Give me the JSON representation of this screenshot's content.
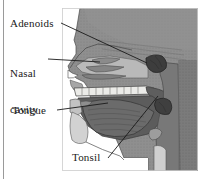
{
  "figure": {
    "type": "anatomical-illustration",
    "style": "grayscale halftone medical diagram",
    "width": 198,
    "height": 179,
    "background_color": "#ffffff",
    "border_rule_color": "#9a9a9a",
    "label_text_color": "#1a1a1a",
    "leader_line_color": "#1a1a1a",
    "tissue_color": "#8f8f8f",
    "tissue_dark_color": "#5a5a5a",
    "tissue_darkest_color": "#3c3c3c",
    "tissue_light_color": "#b8b8b8",
    "airway_color": "#6e6e6e",
    "bone_color": "#e8e8e6"
  },
  "labels": [
    {
      "id": "adenoids",
      "text": "Adenoids",
      "name": "label-adenoids",
      "points_to": "adenoid mass on the roof of the nasopharynx"
    },
    {
      "id": "nasal_cavity",
      "text": "Nasal\ncavity",
      "line1": "Nasal",
      "line2": "cavity",
      "name": "label-nasal-cavity",
      "points_to": "nasal passage with turbinates"
    },
    {
      "id": "tongue",
      "text": "Tongue",
      "name": "label-tongue",
      "points_to": "tongue body in the oral cavity"
    },
    {
      "id": "tonsil",
      "text": "Tonsil",
      "name": "label-tonsil",
      "points_to": "palatine tonsil at the side of the throat"
    }
  ],
  "structures": [
    {
      "id": "adenoids",
      "label": "Adenoids"
    },
    {
      "id": "nasal_cavity",
      "label": "Nasal cavity"
    },
    {
      "id": "tongue",
      "label": "Tongue"
    },
    {
      "id": "tonsil",
      "label": "Tonsil"
    },
    {
      "id": "hard_palate",
      "label": "Hard palate"
    },
    {
      "id": "soft_palate",
      "label": "Soft palate"
    },
    {
      "id": "pharynx",
      "label": "Pharynx"
    }
  ]
}
